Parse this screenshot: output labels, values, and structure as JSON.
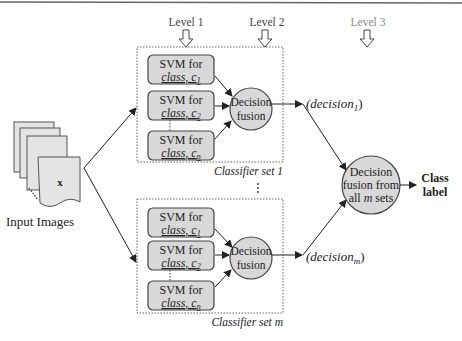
{
  "levels": [
    {
      "label": "Level  1"
    },
    {
      "label": "Level  2"
    },
    {
      "label": "Level  3"
    }
  ],
  "input": {
    "label": "Input Images",
    "symbol": "x"
  },
  "classifier_sets": [
    {
      "label": "Classifier set 1",
      "svms": [
        {
          "line1": "SVM for",
          "line2": "class, c",
          "sub": "1"
        },
        {
          "line1": "SVM for",
          "line2": "class, c",
          "sub": "2"
        },
        {
          "line1": "SVM for",
          "line2": "class, c",
          "sub": "n"
        }
      ],
      "fusion": {
        "line1": "Decision",
        "line2": "fusion"
      },
      "output": {
        "text": "(decision",
        "sub": "1",
        "close": ")"
      }
    },
    {
      "label": "Classifier set m",
      "svms": [
        {
          "line1": "SVM for",
          "line2": "class, c",
          "sub": "1"
        },
        {
          "line1": "SVM for",
          "line2": "class, c",
          "sub": "2"
        },
        {
          "line1": "SVM for",
          "line2": "class, c",
          "sub": "n"
        }
      ],
      "fusion": {
        "line1": "Decision",
        "line2": "fusion"
      },
      "output": {
        "text": "(decision",
        "sub": "m",
        "close": ")"
      }
    }
  ],
  "final_fusion": {
    "line1": "Decision",
    "line2": "fusion from",
    "line3_pre": "all ",
    "line3_em": "m",
    "line3_post": " sets"
  },
  "result": {
    "line1": "Class",
    "line2": "label"
  },
  "colors": {
    "box_fill": "#d8d8d8",
    "circle_fill": "#d8d8d8",
    "stroke": "#333333",
    "dotted": "#666666"
  }
}
